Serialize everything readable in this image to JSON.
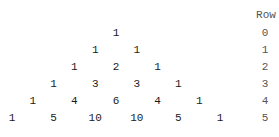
{
  "header": {
    "row_label": "Row"
  },
  "triangle": {
    "rows": [
      [
        "1"
      ],
      [
        "1",
        "1"
      ],
      [
        "1",
        "2",
        "1"
      ],
      [
        "1",
        "3",
        "3",
        "1"
      ],
      [
        "1",
        "4",
        "6",
        "4",
        "1"
      ],
      [
        "1",
        "5",
        "10",
        "10",
        "5",
        "1"
      ]
    ],
    "row_numbers": [
      "0",
      "1",
      "2",
      "3",
      "4",
      "5"
    ]
  }
}
